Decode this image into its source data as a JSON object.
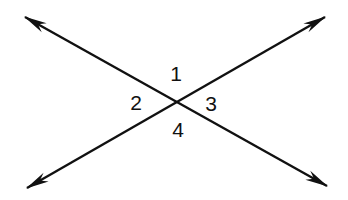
{
  "figure": {
    "kind": "geometry-diagram",
    "background_color": "#ffffff",
    "stroke_color": "#111111",
    "line_width": 2.4,
    "intersection": {
      "x": 178,
      "y": 103
    },
    "lines": [
      {
        "name": "line-nw-se",
        "from": {
          "x": 25,
          "y": 17
        },
        "to": {
          "x": 327,
          "y": 186
        },
        "arrow_start": true,
        "arrow_end": true
      },
      {
        "name": "line-sw-ne",
        "from": {
          "x": 27,
          "y": 188
        },
        "to": {
          "x": 325,
          "y": 17
        },
        "arrow_start": true,
        "arrow_end": true
      }
    ],
    "labels": [
      {
        "id": "label-1",
        "text": "1",
        "x": 176,
        "y": 73,
        "position": "top"
      },
      {
        "id": "label-2",
        "text": "2",
        "x": 136,
        "y": 102,
        "position": "left"
      },
      {
        "id": "label-3",
        "text": "3",
        "x": 211,
        "y": 103,
        "position": "right"
      },
      {
        "id": "label-4",
        "text": "4",
        "x": 178,
        "y": 129,
        "position": "bottom"
      }
    ]
  }
}
